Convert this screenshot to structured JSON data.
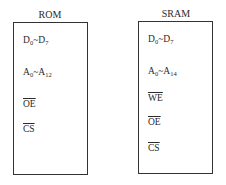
{
  "chips": [
    {
      "name": "ROM",
      "pins": [
        {
          "label": "D",
          "from": "0",
          "sep": "~",
          "label2": "D",
          "to": "7",
          "active_low": false
        },
        {
          "label": "A",
          "from": "0",
          "sep": "~",
          "label2": "A",
          "to": "12",
          "active_low": false
        },
        {
          "label": "OE",
          "active_low": true
        },
        {
          "label": "CS",
          "active_low": true
        }
      ]
    },
    {
      "name": "SRAM",
      "pins": [
        {
          "label": "D",
          "from": "0",
          "sep": "~",
          "label2": "D",
          "to": "7",
          "active_low": false
        },
        {
          "label": "A",
          "from": "0",
          "sep": "~",
          "label2": "A",
          "to": "14",
          "active_low": false
        },
        {
          "label": "WE",
          "active_low": true
        },
        {
          "label": "OE",
          "active_low": true
        },
        {
          "label": "CS",
          "active_low": true
        }
      ]
    }
  ]
}
